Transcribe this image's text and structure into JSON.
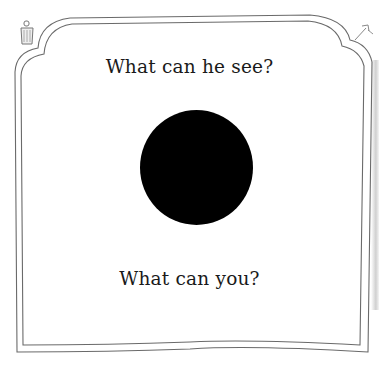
{
  "page": {
    "background_color": "#ffffff",
    "ink_color": "#1a1a1a",
    "frame_color": "#555555"
  },
  "text": {
    "question_top": "What can he see?",
    "question_bottom": "What can you?"
  },
  "illustration": {
    "shape": "circle",
    "fill_color": "#000000"
  },
  "decorations": {
    "top_left_icon": "lantern-icon",
    "top_right_icon": "arrow-sketch-icon"
  }
}
